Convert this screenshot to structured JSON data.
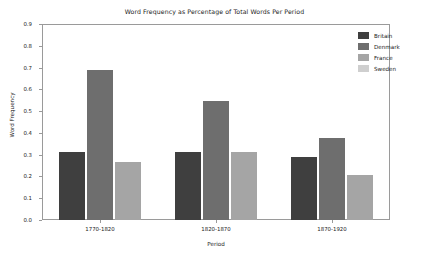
{
  "chart_data": {
    "type": "bar",
    "title": "Word Frequency as Percentage of Total Words Per Period",
    "xlabel": "Period",
    "ylabel": "Word Frequency",
    "categories": [
      "1770-1820",
      "1820-1870",
      "1870-1920"
    ],
    "ylim": [
      0.0,
      0.9
    ],
    "yticks": [
      "0.0",
      "0.1",
      "0.2",
      "0.3",
      "0.4",
      "0.5",
      "0.6",
      "0.7",
      "0.8",
      "0.9"
    ],
    "grid": false,
    "legend_position": "top-right",
    "series": [
      {
        "name": "Britain",
        "color": "#3f3f3f",
        "values": [
          0.31,
          0.31,
          0.29
        ]
      },
      {
        "name": "Denmark",
        "color": "#6e6e6e",
        "values": [
          0.69,
          0.545,
          0.375
        ]
      },
      {
        "name": "France",
        "color": "#a5a5a5",
        "values": [
          0.265,
          0.31,
          0.205
        ]
      },
      {
        "name": "Sweden",
        "color": "#cfcfcf",
        "values": [
          0.0,
          0.0,
          0.0
        ]
      }
    ]
  }
}
